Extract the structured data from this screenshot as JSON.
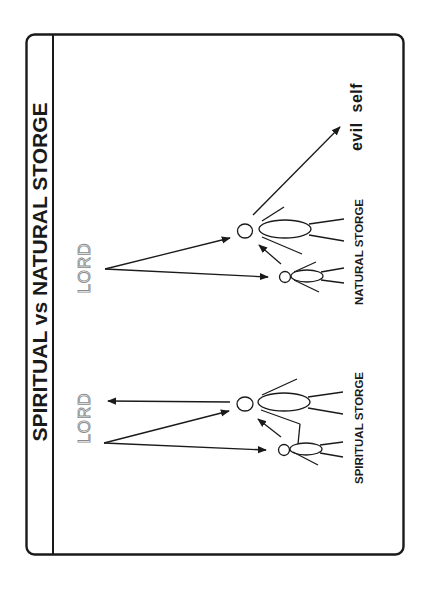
{
  "slide": {
    "title": "SPIRITUAL vs NATURAL STORGE",
    "frame_color": "#1a1a1a",
    "background": "#ffffff"
  },
  "spiritual_group": {
    "lord_label": "LORD",
    "caption": "SPIRITUAL STORGE"
  },
  "natural_group": {
    "lord_label": "LORD",
    "caption": "NATURAL STORGE",
    "target_label": "evil  self"
  },
  "diagram": {
    "orientation": "rotated 90° counter-clockwise",
    "nodes": [
      {
        "id": "lord-spiritual",
        "label": "LORD"
      },
      {
        "id": "lord-natural",
        "label": "LORD"
      },
      {
        "id": "spiritual-parent",
        "type": "stick-figure-large"
      },
      {
        "id": "spiritual-child",
        "type": "stick-figure-small"
      },
      {
        "id": "natural-parent",
        "type": "stick-figure-large"
      },
      {
        "id": "natural-child",
        "type": "stick-figure-small"
      },
      {
        "id": "evil-self",
        "label": "evil self"
      }
    ],
    "edges": [
      {
        "from": "lord-spiritual",
        "to": "spiritual-parent"
      },
      {
        "from": "lord-spiritual",
        "to": "spiritual-child"
      },
      {
        "from": "spiritual-child",
        "to": "spiritual-parent"
      },
      {
        "from": "spiritual-parent",
        "to": "lord-spiritual"
      },
      {
        "from": "lord-natural",
        "to": "natural-parent"
      },
      {
        "from": "lord-natural",
        "to": "natural-child"
      },
      {
        "from": "natural-child",
        "to": "natural-parent"
      },
      {
        "from": "natural-parent",
        "to": "evil-self"
      }
    ]
  }
}
